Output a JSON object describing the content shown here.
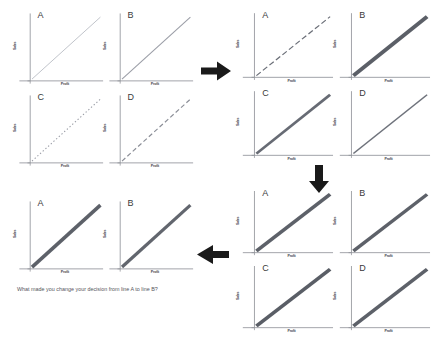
{
  "figure": {
    "axis": {
      "xlabel": "Profit",
      "ylabel": "Sales"
    },
    "colors": {
      "axis": "#8d8f96",
      "letter": "#3a3a3a",
      "label": "#4a4a52",
      "arrow": "#1a1a1a",
      "caption": "#55555c",
      "line_light": "#b9bcc4",
      "line_medium": "#9a9da6",
      "line_dark": "#6b6f78",
      "line_heavy": "#55585f",
      "background": "#ffffff"
    },
    "caption": "What made you change your decision from line A to line B?"
  },
  "arrows": [
    {
      "name": "arrow-stage1-to-stage2",
      "direction": "right",
      "label": "→"
    },
    {
      "name": "arrow-stage2-to-stage3",
      "direction": "down",
      "label": "↓"
    },
    {
      "name": "arrow-stage3-to-stage4",
      "direction": "left",
      "label": "←"
    }
  ],
  "stages": [
    {
      "id": "stage-1",
      "name": "stage-1-initial-options",
      "position": "top-left",
      "panels": [
        {
          "letter": "A",
          "style": "solid",
          "width": 1.0,
          "color": "#b9bcc4",
          "dash": "none"
        },
        {
          "letter": "B",
          "style": "solid",
          "width": 1.2,
          "color": "#9a9da6",
          "dash": "none"
        },
        {
          "letter": "C",
          "style": "dotted",
          "width": 1.2,
          "color": "#9a9da6",
          "dash": "1.5 2.5"
        },
        {
          "letter": "D",
          "style": "dashed",
          "width": 1.3,
          "color": "#8b8e97",
          "dash": "5 3"
        }
      ]
    },
    {
      "id": "stage-2",
      "name": "stage-2-refined-options",
      "position": "top-right",
      "panels": [
        {
          "letter": "A",
          "style": "dashed",
          "width": 1.3,
          "color": "#6b6f78",
          "dash": "6 3"
        },
        {
          "letter": "B",
          "style": "solid",
          "width": 4.2,
          "color": "#5b5f67",
          "dash": "none"
        },
        {
          "letter": "C",
          "style": "solid",
          "width": 3.0,
          "color": "#676b74",
          "dash": "none"
        },
        {
          "letter": "D",
          "style": "solid",
          "width": 1.6,
          "color": "#6f737c",
          "dash": "none"
        }
      ]
    },
    {
      "id": "stage-3",
      "name": "stage-3-converged-options",
      "position": "bottom-right",
      "panels": [
        {
          "letter": "A",
          "style": "solid",
          "width": 4.0,
          "color": "#5d6169",
          "dash": "none"
        },
        {
          "letter": "B",
          "style": "solid",
          "width": 3.8,
          "color": "#5d6169",
          "dash": "none"
        },
        {
          "letter": "C",
          "style": "solid",
          "width": 4.0,
          "color": "#5a5e66",
          "dash": "none"
        },
        {
          "letter": "D",
          "style": "solid",
          "width": 3.9,
          "color": "#5d6169",
          "dash": "none"
        }
      ]
    },
    {
      "id": "stage-4",
      "name": "stage-4-final-pair",
      "position": "bottom-left",
      "panels": [
        {
          "letter": "A",
          "style": "solid",
          "width": 4.0,
          "color": "#5d6169",
          "dash": "none"
        },
        {
          "letter": "B",
          "style": "solid",
          "width": 3.6,
          "color": "#62666e",
          "dash": "none"
        }
      ]
    }
  ],
  "chart_data": {
    "type": "line",
    "xlabel": "Profit",
    "ylabel": "Sales",
    "xlim": [
      0,
      10
    ],
    "ylim": [
      0,
      10
    ],
    "grid": false,
    "legend": "none",
    "x": [
      0,
      10
    ],
    "series": [
      {
        "name": "stage-1-A",
        "values": [
          0,
          9.4
        ]
      },
      {
        "name": "stage-1-B",
        "values": [
          0,
          9.4
        ]
      },
      {
        "name": "stage-1-C",
        "values": [
          0,
          9.4
        ]
      },
      {
        "name": "stage-1-D",
        "values": [
          0,
          9.4
        ]
      },
      {
        "name": "stage-2-A",
        "values": [
          0,
          9.4
        ]
      },
      {
        "name": "stage-2-B",
        "values": [
          0,
          9.4
        ]
      },
      {
        "name": "stage-2-C",
        "values": [
          0,
          9.4
        ]
      },
      {
        "name": "stage-2-D",
        "values": [
          0,
          9.4
        ]
      },
      {
        "name": "stage-3-A",
        "values": [
          0,
          9.4
        ]
      },
      {
        "name": "stage-3-B",
        "values": [
          0,
          9.4
        ]
      },
      {
        "name": "stage-3-C",
        "values": [
          0,
          9.4
        ]
      },
      {
        "name": "stage-3-D",
        "values": [
          0,
          9.4
        ]
      },
      {
        "name": "stage-4-A",
        "values": [
          0,
          9.4
        ]
      },
      {
        "name": "stage-4-B",
        "values": [
          0,
          9.4
        ]
      }
    ],
    "annotations": [
      "What made you change your decision from line A to line B?"
    ]
  }
}
